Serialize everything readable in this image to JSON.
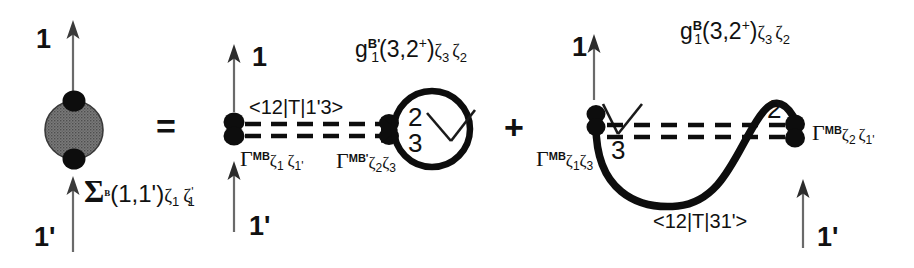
{
  "figure": {
    "type": "feynman-diagram",
    "background_color": "#ffffff",
    "ink_color": "#111111",
    "blob_fill": "#6e6e6e",
    "operators": {
      "equals": "=",
      "plus": "+"
    }
  },
  "lhs": {
    "name": "self-energy-blob",
    "top_leg_label": "1",
    "bottom_leg_label": "1'",
    "caption": {
      "symbol": "Σ",
      "superscript": "B",
      "arguments": "(1,1')",
      "subscript_1": "ζ",
      "subscript_1_index": "1",
      "subscript_2": "ζ",
      "subscript_2_index": "1",
      "subscript_2_prime": "'",
      "full_text": "Σ B (1,1') ζ1 ζ1'"
    }
  },
  "term1": {
    "name": "first-term",
    "top_leg_label": "1",
    "bottom_leg_label": "1'",
    "interaction_label": "<12|T|1'3>",
    "left_vertex": {
      "symbol": "Γ",
      "superscript": "MB",
      "subscripts": [
        "ζ",
        "1",
        "ζ",
        "1'"
      ],
      "full_text": "Γ MB ζ1 ζ1'"
    },
    "right_vertex": {
      "symbol": "Γ",
      "superscript": "MB'",
      "subscripts": [
        "ζ",
        "2",
        "ζ",
        "3"
      ],
      "full_text": "Γ MB' ζ2ζ3"
    },
    "propagator": {
      "symbol": "g",
      "sub_index": "1",
      "superscript": "B'",
      "arguments": "(3,2",
      "arg_sup": "+",
      "arg_close": ")",
      "zeta_a": "ζ",
      "zeta_a_idx": "3",
      "zeta_b": "ζ",
      "zeta_b_idx": "2",
      "full_text": "g1 B' (3,2+) ζ3ζ2"
    },
    "loop_labels": {
      "upper": "2",
      "lower": "3"
    }
  },
  "term2": {
    "name": "second-term",
    "top_leg_label": "1",
    "bottom_leg_label": "1'",
    "interaction_label": "<12|T|31'>",
    "left_vertex": {
      "symbol": "Γ",
      "superscript": "MB",
      "subscripts": [
        "ζ",
        "1",
        "ζ",
        "3"
      ],
      "full_text": "Γ MB ζ1ζ3"
    },
    "right_vertex": {
      "symbol": "Γ",
      "superscript": "MB",
      "subscripts": [
        "ζ",
        "2",
        "ζ",
        "1'"
      ],
      "full_text": "Γ MB ζ2ζ1'"
    },
    "propagator": {
      "symbol": "g",
      "sub_index": "1",
      "superscript": "B",
      "arguments": "(3,2",
      "arg_sup": "+",
      "arg_close": ")",
      "zeta_a": "ζ",
      "zeta_a_idx": "3",
      "zeta_b": "ζ",
      "zeta_b_idx": "2",
      "full_text": "g1 B (3,2+) ζ3ζ2"
    },
    "line_labels": {
      "left": "3",
      "right": "2"
    }
  }
}
